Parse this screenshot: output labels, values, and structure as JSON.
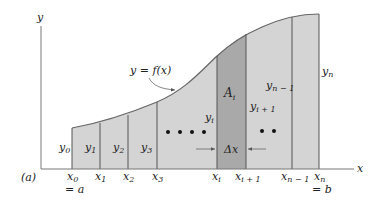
{
  "figure": {
    "panel_label": "(a)",
    "axis_labels": {
      "x": "x",
      "y": "y"
    },
    "curve_label": "y = f(x)",
    "area_label": {
      "base": "A",
      "sub": "i"
    },
    "delta_label": "Δx",
    "colors": {
      "fill_light": "#d4d4d4",
      "fill_highlight": "#a9a9a9",
      "lines": "#555555",
      "axes": "#666666",
      "text": "#222222"
    },
    "x_ticks": [
      {
        "base": "x",
        "sub": "0",
        "below": "= a"
      },
      {
        "base": "x",
        "sub": "1",
        "below": ""
      },
      {
        "base": "x",
        "sub": "2",
        "below": ""
      },
      {
        "base": "x",
        "sub": "3",
        "below": ""
      },
      {
        "base": "x",
        "sub": "i",
        "below": ""
      },
      {
        "base": "x",
        "sub": "i + 1",
        "below": ""
      },
      {
        "base": "x",
        "sub": "n − 1",
        "below": ""
      },
      {
        "base": "x",
        "sub": "n",
        "below": "= b"
      }
    ],
    "y_labels": [
      {
        "base": "y",
        "sub": "0"
      },
      {
        "base": "y",
        "sub": "1"
      },
      {
        "base": "y",
        "sub": "2"
      },
      {
        "base": "y",
        "sub": "3"
      },
      {
        "base": "y",
        "sub": "i"
      },
      {
        "base": "y",
        "sub": "i + 1"
      },
      {
        "base": "y",
        "sub": "n − 1"
      },
      {
        "base": "y",
        "sub": "n"
      }
    ],
    "ellipsis_left": "• • • •",
    "ellipsis_right": "• •"
  }
}
